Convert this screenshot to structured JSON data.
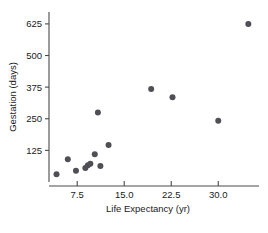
{
  "chart_data": {
    "type": "scatter",
    "title": "",
    "xlabel": "Life Expectancy (yr)",
    "ylabel": "Gestation (days)",
    "xlim": [
      3.0,
      36.5
    ],
    "ylim": [
      0,
      672
    ],
    "grid": false,
    "legend": null,
    "xticks": [
      7.5,
      15.0,
      22.5,
      30.0
    ],
    "xtick_labels": [
      "7.5",
      "15.0",
      "22.5",
      "30.0"
    ],
    "yticks": [
      125,
      250,
      375,
      500,
      625
    ],
    "ytick_labels": [
      "125",
      "250",
      "375",
      "500",
      "625"
    ],
    "point_color": "#4f4f55",
    "point_radius": 3.0,
    "points": [
      {
        "x": 4.2,
        "y": 31
      },
      {
        "x": 6.0,
        "y": 90
      },
      {
        "x": 7.3,
        "y": 44
      },
      {
        "x": 8.8,
        "y": 55
      },
      {
        "x": 9.2,
        "y": 66
      },
      {
        "x": 9.6,
        "y": 72
      },
      {
        "x": 10.3,
        "y": 110
      },
      {
        "x": 10.8,
        "y": 275
      },
      {
        "x": 11.2,
        "y": 63
      },
      {
        "x": 12.5,
        "y": 146
      },
      {
        "x": 19.3,
        "y": 368
      },
      {
        "x": 22.7,
        "y": 335
      },
      {
        "x": 30.0,
        "y": 242
      },
      {
        "x": 34.8,
        "y": 625
      }
    ]
  },
  "axes": {
    "x_axis_name": "x-axis",
    "y_axis_name": "y-axis"
  }
}
